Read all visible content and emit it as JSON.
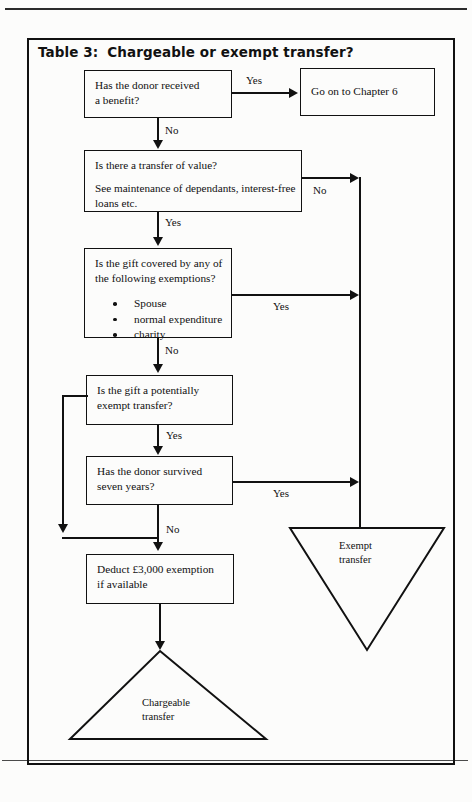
{
  "page": {
    "running_header": "",
    "title_number": "Table 3:",
    "title_text": "Chargeable or exempt transfer?"
  },
  "nodes": {
    "q1": {
      "line1": "Has the donor received",
      "line2": "a benefit?"
    },
    "chapter": {
      "line1": "Go on to Chapter 6"
    },
    "q2": {
      "line1": "Is there a transfer of value?",
      "line2": "See maintenance of dependants, interest-free",
      "line3": "loans etc."
    },
    "q3": {
      "line1": "Is the gift covered by any of",
      "line2": "the following exemptions?",
      "bullets": [
        "Spouse",
        "normal expenditure",
        "charity"
      ]
    },
    "q4": {
      "line1": "Is the gift a potentially",
      "line2": "exempt transfer?"
    },
    "q5": {
      "line1": "Has the donor survived",
      "line2": "seven years?"
    },
    "q6": {
      "line1": "Deduct £3,000 exemption",
      "line2": "if available"
    }
  },
  "terminals": {
    "exempt": {
      "line1": "Exempt",
      "line2": "transfer"
    },
    "chargeable": {
      "line1": "Chargeable",
      "line2": "transfer"
    }
  },
  "edges": {
    "q1_yes": "Yes",
    "q1_no": "No",
    "q2_no": "No",
    "q2_yes": "Yes",
    "q3_yes": "Yes",
    "q3_no": "No",
    "q4_yes": "Yes",
    "q5_yes": "Yes",
    "q5_no": "No"
  },
  "colors": {
    "ink": "#111111",
    "paper": "#fcfcfb"
  }
}
